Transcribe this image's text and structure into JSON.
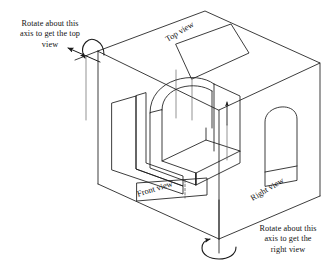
{
  "figure": {
    "kind": "glass-box-orthographic-projection-diagram",
    "background_color": "#ffffff",
    "line_color": "#1a1a1a",
    "thin_line_color": "#555555",
    "annotations": {
      "top_left_rotation_note": "Rotate about this\naxis to get the top\nview",
      "bottom_right_rotation_note": "Rotate about this\naxis to get the\nright view"
    },
    "view_labels": {
      "top": "Top view",
      "front": "Front view",
      "right": "Right view"
    },
    "icons": {
      "top_rotation_arrow": "curved-double-arrow-icon",
      "bottom_rotation_arrow": "elliptical-rotation-arrow-icon",
      "vertical_axis": "vertical-axis-line-icon",
      "projection_arrow": "up-arrow-icon"
    },
    "object": {
      "name": "arch-block-solid",
      "description": "Rectangular block with a semicircular arch cut through it"
    }
  }
}
